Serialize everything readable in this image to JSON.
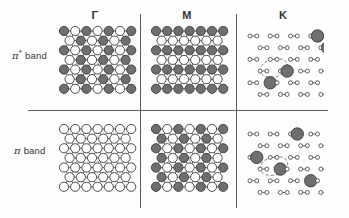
{
  "figure": {
    "background_color": "#fdfdfd",
    "line_color": "#5a5a5a"
  },
  "columns": [
    {
      "id": "gamma",
      "label": "Γ"
    },
    {
      "id": "m",
      "label": "M"
    },
    {
      "id": "k",
      "label": "K"
    }
  ],
  "rows": [
    {
      "id": "pi-star",
      "pi_symbol": "π",
      "star": "*",
      "band_word": "band"
    },
    {
      "id": "pi",
      "pi_symbol": "π",
      "star": "",
      "band_word": "band"
    }
  ],
  "legend": {
    "filled_circle": "filled-orbital-positive-phase",
    "open_circle": "open-orbital-negative-phase",
    "dashed_ellipse": "unit-cell-marker"
  },
  "colors": {
    "filled_fill": "#6f6f6f",
    "filled_stroke": "#3a3a3a",
    "open_fill": "#ffffff",
    "open_stroke": "#3a3a3a",
    "bond_stroke": "#4a4a4a",
    "dashed_stroke": "#6a6a6a"
  },
  "panels": [
    {
      "id": "pi-star-gamma",
      "row": "pi-star",
      "column": "gamma",
      "style": "dense-lattice",
      "description": "Alternating filled and open circles on every site; bonding-antibonding alternation in both directions",
      "pattern": "alternate-site",
      "circle_radius": 4.6,
      "has_unit_cell": true
    },
    {
      "id": "pi-star-m",
      "row": "pi-star",
      "column": "m",
      "style": "dense-lattice",
      "description": "Row-striped pattern of filled and open circles",
      "pattern": "row-stripe",
      "circle_radius": 4.6,
      "has_unit_cell": true
    },
    {
      "id": "pi-star-k",
      "row": "pi-star",
      "column": "k",
      "style": "open-honeycomb",
      "description": "Honeycomb net of small open vertices with a few large filled circles",
      "pattern": "sparse-large",
      "circle_radius": 2.0,
      "large_radius": 6.2,
      "has_unit_cell": true
    },
    {
      "id": "pi-gamma",
      "row": "pi",
      "column": "gamma",
      "style": "dense-lattice",
      "description": "All open circles; fully bonding uniform state",
      "pattern": "all-open",
      "circle_radius": 4.6,
      "has_unit_cell": true
    },
    {
      "id": "pi-m",
      "row": "pi",
      "column": "m",
      "style": "dense-lattice",
      "description": "Column-striped pattern of filled and open circles",
      "pattern": "col-stripe",
      "circle_radius": 4.6,
      "has_unit_cell": true
    },
    {
      "id": "pi-k",
      "row": "pi",
      "column": "k",
      "style": "open-honeycomb",
      "description": "Honeycomb net of small open vertices with a few large filled circles in a diagonal arrangement",
      "pattern": "sparse-large-diagonal",
      "circle_radius": 2.0,
      "large_radius": 6.2,
      "has_unit_cell": true
    }
  ]
}
